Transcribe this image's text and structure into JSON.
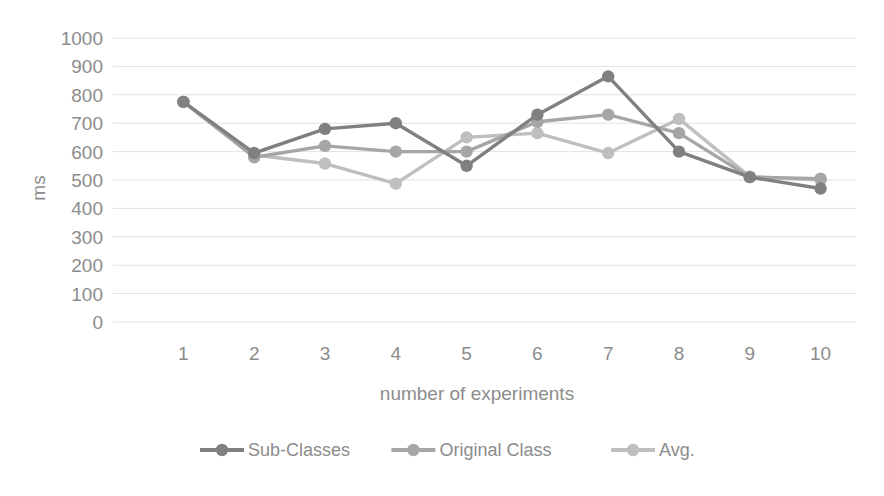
{
  "chart_data": {
    "type": "line",
    "title": "",
    "xlabel": "number of experiments",
    "ylabel": "ms",
    "categories": [
      "1",
      "2",
      "3",
      "4",
      "5",
      "6",
      "7",
      "8",
      "9",
      "10"
    ],
    "x": [
      1,
      2,
      3,
      4,
      5,
      6,
      7,
      8,
      9,
      10
    ],
    "ylim": [
      0,
      1000
    ],
    "ytick_labels": [
      "1000",
      "900",
      "800",
      "700",
      "600",
      "500",
      "400",
      "300",
      "200",
      "100",
      "0"
    ],
    "yticks": [
      1000,
      900,
      800,
      700,
      600,
      500,
      400,
      300,
      200,
      100,
      0
    ],
    "grid": true,
    "legend_position": "bottom",
    "series": [
      {
        "name": "Sub-Classes",
        "color": "#808080",
        "values": [
          775,
          595,
          680,
          700,
          550,
          730,
          865,
          600,
          510,
          470
        ]
      },
      {
        "name": "Original Class",
        "color": "#a6a6a6",
        "values": [
          775,
          580,
          620,
          600,
          600,
          705,
          730,
          665,
          510,
          505
        ]
      },
      {
        "name": "Avg.",
        "color": "#bfbfbf",
        "values": [
          775,
          588,
          558,
          487,
          650,
          665,
          595,
          715,
          512,
          500
        ]
      }
    ]
  },
  "legend": {
    "items": [
      {
        "label": "Sub-Classes",
        "color": "#808080"
      },
      {
        "label": "Original Class",
        "color": "#a6a6a6"
      },
      {
        "label": "Avg.",
        "color": "#bfbfbf"
      }
    ]
  },
  "axes": {
    "y_title": "ms",
    "x_title": "number of experiments"
  }
}
